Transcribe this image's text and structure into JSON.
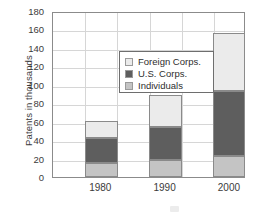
{
  "chart_data": {
    "type": "bar",
    "stacked": true,
    "title": "",
    "xlabel": "",
    "ylabel": "Patents in thousands",
    "categories": [
      "1980",
      "1990",
      "2000"
    ],
    "ylim": [
      0,
      180
    ],
    "yticks": [
      0,
      20,
      40,
      60,
      80,
      100,
      120,
      140,
      160,
      180
    ],
    "grid": true,
    "legend_position": "upper left inside",
    "series": [
      {
        "name": "Individuals",
        "color": "#c4c4c4",
        "values": [
          15,
          18,
          23
        ]
      },
      {
        "name": "U.S. Corps.",
        "color": "#5e5e5e",
        "values": [
          27,
          36,
          70
        ]
      },
      {
        "name": "Foreign Corps.",
        "color": "#ebebeb",
        "values": [
          19,
          35,
          63
        ]
      }
    ],
    "totals": [
      61,
      89,
      156
    ],
    "cumulative_tops": [
      {
        "individuals": 15,
        "us_corps": 42,
        "foreign_corps": 61
      },
      {
        "individuals": 18,
        "us_corps": 54,
        "foreign_corps": 89
      },
      {
        "individuals": 23,
        "us_corps": 93,
        "foreign_corps": 156
      }
    ]
  },
  "legend": {
    "items": [
      {
        "label": "Foreign Corps.",
        "color": "#ebebeb"
      },
      {
        "label": "U.S. Corps.",
        "color": "#5e5e5e"
      },
      {
        "label": "Individuals",
        "color": "#c4c4c4"
      }
    ]
  },
  "axes": {
    "y_title": "Patents in thousands",
    "y_ticks": [
      "180",
      "160",
      "140",
      "120",
      "100",
      "80",
      "60",
      "40",
      "20",
      "0"
    ],
    "x_ticks": [
      "1980",
      "1990",
      "2000"
    ]
  },
  "colors": {
    "frame": "#8b8b8b",
    "gridline": "#d6d6d6",
    "text": "#3b3b3b",
    "background": "#ffffff"
  }
}
